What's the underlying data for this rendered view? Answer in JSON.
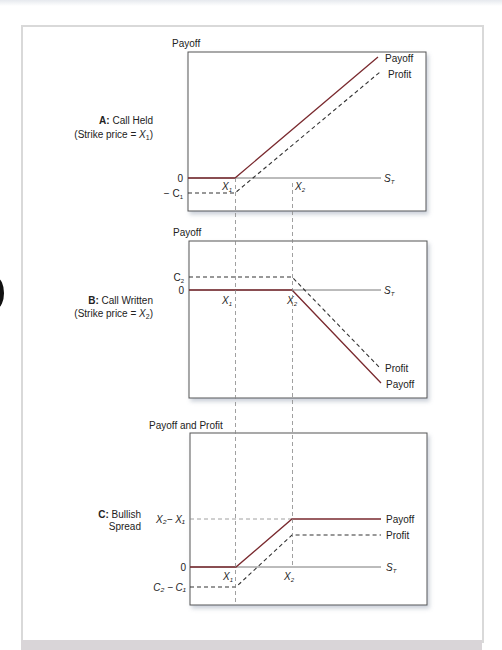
{
  "figure": {
    "panels": [
      {
        "id": "A",
        "title_bold": "A:",
        "title": "Call Held",
        "subtitle_prefix": "(Strike price = ",
        "subtitle_var": "X",
        "subtitle_sub": "1",
        "subtitle_suffix": ")",
        "y_axis_label": "Payoff",
        "line_labels": {
          "payoff": "Payoff",
          "profit": "Profit"
        },
        "y_ticks": [
          {
            "label": "0"
          },
          {
            "label": "− C",
            "sub": "1"
          }
        ],
        "x_ticks": [
          {
            "label": "X",
            "sub": "1"
          },
          {
            "label": "X",
            "sub": "2"
          }
        ],
        "x_axis_label": "S",
        "x_axis_sub": "T"
      },
      {
        "id": "B",
        "title_bold": "B:",
        "title": "Call Written",
        "subtitle_prefix": "(Strike price = ",
        "subtitle_var": "X",
        "subtitle_sub": "2",
        "subtitle_suffix": ")",
        "y_axis_label": "Payoff",
        "line_labels": {
          "payoff": "Payoff",
          "profit": "Profit"
        },
        "y_ticks": [
          {
            "label": "C",
            "sub": "2"
          },
          {
            "label": "0"
          }
        ],
        "x_ticks": [
          {
            "label": "X",
            "sub": "1"
          },
          {
            "label": "X",
            "sub": "2"
          }
        ],
        "x_axis_label": "S",
        "x_axis_sub": "T"
      },
      {
        "id": "C",
        "title_bold": "C:",
        "title": "Bullish",
        "title_line2": "Spread",
        "y_axis_label": "Payoff and Profit",
        "line_labels": {
          "payoff": "Payoff",
          "profit": "Profit"
        },
        "y_ticks": [
          {
            "label": "X₂− X₁"
          },
          {
            "label": "0"
          },
          {
            "label": "C₂ − C₁"
          }
        ],
        "x_ticks": [
          {
            "label": "X",
            "sub": "1"
          },
          {
            "label": "X",
            "sub": "2"
          }
        ],
        "x_axis_label": "S",
        "x_axis_sub": "T"
      }
    ],
    "colors": {
      "payoff_line": "#7a2a2f",
      "profit_line": "#333333",
      "axis": "#555555",
      "guide": "#888888",
      "frame": "#d9d9d9"
    }
  }
}
